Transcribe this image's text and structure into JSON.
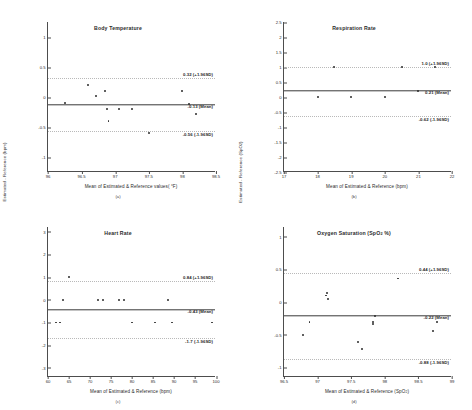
{
  "chart_data": [
    {
      "type": "scatter",
      "panel": "(a)",
      "title": "Body Temperature",
      "xlabel": "Mean of Estimated & Reference values( °F)",
      "ylabel": "Estimated - Reference ( °F)",
      "xlim": [
        96,
        98.5
      ],
      "ylim": [
        -1.25,
        1.25
      ],
      "xticks": [
        "96",
        "96.5",
        "97",
        "97.5",
        "98",
        "98.5"
      ],
      "xtick_values": [
        96,
        96.5,
        97,
        97.5,
        98,
        98.5
      ],
      "yticks": [
        "1",
        "0.5",
        "0",
        "-0.5",
        "-1"
      ],
      "ytick_values": [
        1,
        0.5,
        0,
        -0.5,
        -1
      ],
      "grid": false,
      "legend": "none",
      "mean": -0.13,
      "upper_loa": 0.32,
      "lower_loa": -0.56,
      "mean_label": "-0.13 (Mean)",
      "upper_label": "0.32 (+1.96SD)",
      "lower_label": "-0.56 (-1.96SD)",
      "points": [
        {
          "x": 96.25,
          "y": -0.1
        },
        {
          "x": 96.6,
          "y": 0.2
        },
        {
          "x": 96.72,
          "y": 0.02
        },
        {
          "x": 96.85,
          "y": 0.1
        },
        {
          "x": 96.88,
          "y": -0.2
        },
        {
          "x": 96.9,
          "y": -0.4
        },
        {
          "x": 97.05,
          "y": -0.2
        },
        {
          "x": 97.25,
          "y": -0.2
        },
        {
          "x": 97.5,
          "y": -0.6
        },
        {
          "x": 98.0,
          "y": 0.1
        },
        {
          "x": 98.1,
          "y": -0.12
        },
        {
          "x": 98.2,
          "y": -0.28
        }
      ]
    },
    {
      "type": "scatter",
      "panel": "(b)",
      "title": "Respiration Rate",
      "xlabel": "Mean of Estimated & Reference (bpm)",
      "ylabel": "Estimated - Reference (bpm)",
      "xlim": [
        17,
        22
      ],
      "ylim": [
        -2.5,
        2.5
      ],
      "xticks": [
        "17",
        "18",
        "19",
        "20",
        "21",
        "22"
      ],
      "xtick_values": [
        17,
        18,
        19,
        20,
        21,
        22
      ],
      "yticks": [
        "2.5",
        "2",
        "1.5",
        "1",
        "0.5",
        "0",
        "-0.5",
        "-1",
        "-1.5",
        "-2",
        "-2.5"
      ],
      "ytick_values": [
        2.5,
        2,
        1.5,
        1,
        0.5,
        0,
        -0.5,
        -1,
        -1.5,
        -2,
        -2.5
      ],
      "grid": false,
      "legend": "none",
      "mean": 0.21,
      "upper_loa": 1.0,
      "lower_loa": -0.62,
      "mean_label": "0.21 (Mean)",
      "upper_label": "1.0 (+1.96SD)",
      "lower_label": "-0.62 (-1.96SD)",
      "points": [
        {
          "x": 18.0,
          "y": 0.0
        },
        {
          "x": 18.5,
          "y": 1.0
        },
        {
          "x": 19.0,
          "y": 0.0
        },
        {
          "x": 20.0,
          "y": 0.0
        },
        {
          "x": 20.5,
          "y": 1.0
        },
        {
          "x": 21.0,
          "y": 0.2
        },
        {
          "x": 21.5,
          "y": 1.0
        }
      ]
    },
    {
      "type": "scatter",
      "panel": "(c)",
      "title": "Heart Rate",
      "xlabel": "Mean of Estimated & Reference (bpm)",
      "ylabel": "Estimated - Reference (bpm)",
      "xlim": [
        60,
        100
      ],
      "ylim": [
        -3.4,
        3.2
      ],
      "xticks": [
        "60",
        "65",
        "70",
        "75",
        "80",
        "85",
        "90",
        "95",
        "100"
      ],
      "xtick_values": [
        60,
        65,
        70,
        75,
        80,
        85,
        90,
        95,
        100
      ],
      "yticks": [
        "3",
        "2",
        "1",
        "0",
        "-1",
        "-2",
        "-3"
      ],
      "ytick_values": [
        3,
        2,
        1,
        0,
        -1,
        -2,
        -3
      ],
      "grid": false,
      "legend": "none",
      "mean": -0.43,
      "upper_loa": 0.84,
      "lower_loa": -1.7,
      "mean_label": "-0.43 (Mean)",
      "upper_label": "0.84 (+1.96SD)",
      "lower_label": "-1.7 (-1.96SD)",
      "points": [
        {
          "x": 62.0,
          "y": -1.0
        },
        {
          "x": 62.8,
          "y": -1.0
        },
        {
          "x": 63.5,
          "y": 0.0
        },
        {
          "x": 65.0,
          "y": 1.0
        },
        {
          "x": 72.0,
          "y": 0.0
        },
        {
          "x": 73.0,
          "y": 0.0
        },
        {
          "x": 77.0,
          "y": 0.0
        },
        {
          "x": 78.0,
          "y": 0.0
        },
        {
          "x": 80.0,
          "y": -1.0
        },
        {
          "x": 85.5,
          "y": -1.0
        },
        {
          "x": 88.5,
          "y": 0.0
        },
        {
          "x": 89.5,
          "y": -1.0
        },
        {
          "x": 99.0,
          "y": -1.0
        }
      ]
    },
    {
      "type": "scatter",
      "panel": "(d)",
      "title": "Oxygen Saturation (SpO2 %)",
      "xlabel": "Mean of Estimated & Reference (SpO2)",
      "ylabel": "Estimated - Reference (SpO2)",
      "xlim": [
        96.5,
        99
      ],
      "ylim": [
        -1.15,
        1.15
      ],
      "xticks": [
        "96.5",
        "97",
        "97.5",
        "98",
        "98.5",
        "99"
      ],
      "xtick_values": [
        96.5,
        97,
        97.5,
        98,
        98.5,
        99
      ],
      "yticks": [
        "1",
        "0.5",
        "0",
        "-0.5",
        "-1"
      ],
      "ytick_values": [
        1,
        0.5,
        0,
        -0.5,
        -1
      ],
      "grid": false,
      "legend": "none",
      "mean": -0.22,
      "upper_loa": 0.44,
      "lower_loa": -0.88,
      "mean_label": "-0.22 (Mean)",
      "upper_label": "0.44 (+1.96SD)",
      "lower_label": "-0.88 (-1.96SD)",
      "points": [
        {
          "x": 96.78,
          "y": -0.5
        },
        {
          "x": 96.88,
          "y": -0.3
        },
        {
          "x": 97.12,
          "y": 0.1
        },
        {
          "x": 97.14,
          "y": 0.14
        },
        {
          "x": 97.16,
          "y": 0.05
        },
        {
          "x": 97.6,
          "y": -0.62
        },
        {
          "x": 97.66,
          "y": -0.72
        },
        {
          "x": 97.82,
          "y": -0.3
        },
        {
          "x": 97.83,
          "y": -0.34
        },
        {
          "x": 97.86,
          "y": -0.22
        },
        {
          "x": 98.2,
          "y": 0.36
        },
        {
          "x": 98.72,
          "y": -0.44
        },
        {
          "x": 98.78,
          "y": -0.3
        }
      ]
    }
  ]
}
